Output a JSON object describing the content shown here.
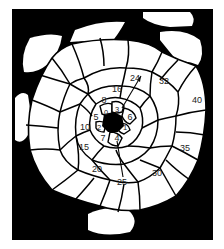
{
  "figure": {
    "type": "phyllotaxis-primordia-diagram",
    "colors": {
      "background": "#000000",
      "cell": "#ffffff",
      "border": "#000000",
      "label": "#222222"
    },
    "labels": [
      {
        "text": "0",
        "x": 106,
        "y": 112
      },
      {
        "text": "1",
        "x": 125,
        "y": 127
      },
      {
        "text": "2",
        "x": 99,
        "y": 127
      },
      {
        "text": "3",
        "x": 117,
        "y": 109
      },
      {
        "text": "4",
        "x": 117,
        "y": 138
      },
      {
        "text": "5",
        "x": 96,
        "y": 117
      },
      {
        "text": "6",
        "x": 130,
        "y": 117
      },
      {
        "text": "7",
        "x": 103,
        "y": 138
      },
      {
        "text": "8",
        "x": 104,
        "y": 100
      },
      {
        "text": "10",
        "x": 85,
        "y": 127
      },
      {
        "text": "15",
        "x": 84,
        "y": 147
      },
      {
        "text": "16",
        "x": 117,
        "y": 89
      },
      {
        "text": "20",
        "x": 97,
        "y": 169
      },
      {
        "text": "24",
        "x": 135,
        "y": 78
      },
      {
        "text": "25",
        "x": 122,
        "y": 182
      },
      {
        "text": "30",
        "x": 157,
        "y": 173
      },
      {
        "text": "32",
        "x": 164,
        "y": 81
      },
      {
        "text": "35",
        "x": 185,
        "y": 148
      },
      {
        "text": "40",
        "x": 197,
        "y": 100
      }
    ]
  }
}
